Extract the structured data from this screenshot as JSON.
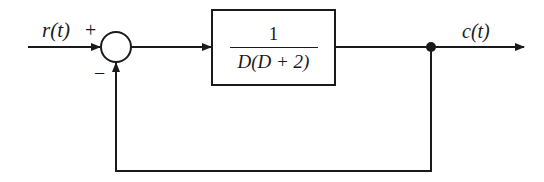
{
  "diagram": {
    "type": "feedback-control-block-diagram",
    "input": {
      "label": "r(t)"
    },
    "summing_junction": {
      "plus_sign": "+",
      "minus_sign": "−"
    },
    "forward_block": {
      "numerator": "1",
      "denominator": "D(D + 2)"
    },
    "output": {
      "label": "c(t)"
    },
    "feedback": {
      "type": "unity",
      "sign": "negative"
    },
    "colors": {
      "line": "#1a1a1a",
      "background": "#ffffff"
    }
  }
}
